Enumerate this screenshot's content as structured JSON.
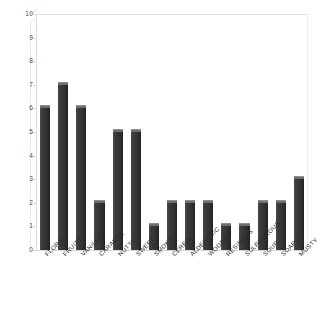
{
  "chart_data": {
    "type": "bar",
    "title": "",
    "subtitle": "",
    "xlabel": "",
    "ylabel": "",
    "ylim": [
      0,
      10
    ],
    "yticks": [
      0,
      1,
      2,
      3,
      4,
      5,
      6,
      7,
      8,
      9,
      10
    ],
    "grid": false,
    "legend": null,
    "categories": [
      "FLORAL",
      "FRUITY",
      "VANILLA",
      "CARAMEL",
      "NUTTY",
      "SWEET",
      "SMOKY",
      "CEREAL",
      "ALDEHYDIC",
      "WOODY",
      "RESINOUS",
      "SULPHUROUS",
      "SOUR",
      "SOAPY",
      "MUSTY"
    ],
    "values": [
      6,
      7,
      6,
      2,
      5,
      5,
      1,
      2,
      2,
      2,
      1,
      1,
      2,
      2,
      3
    ]
  },
  "style": {
    "bar_color": "#343434",
    "bar_cap_color": "#6e6e6e",
    "frame_color": "#e2e2e2",
    "axis_text_color": "#4a4a4a",
    "label_text_color": "#2a2a2a",
    "background": "#ffffff"
  }
}
